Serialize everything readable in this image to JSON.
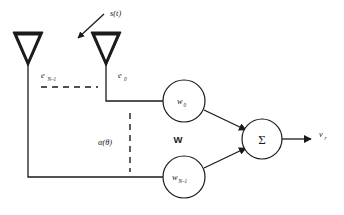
{
  "figure": {
    "kind": "beamformer-block-diagram",
    "background_color": "#ffffff",
    "line_color": "#1a1a1a"
  },
  "labels": {
    "incident_signal": "s(t)",
    "element_signal_top": "e",
    "element_signal_top_sub": "N–1",
    "element_signal_bottom": "e",
    "element_signal_bottom_sub": "0",
    "steering_vector": "α(θ)",
    "weight_vector": "W",
    "weight_top": "w",
    "weight_top_sub": "0",
    "weight_bottom": "w",
    "weight_bottom_sub": "N–1",
    "summation": "Σ",
    "output": "v",
    "output_sub": "r"
  },
  "nodes": [
    {
      "name": "antenna-element-n-minus-1",
      "label": "e",
      "sub": "N–1",
      "x": 28,
      "y": 50
    },
    {
      "name": "antenna-element-0",
      "label": "e",
      "sub": "0",
      "x": 105,
      "y": 50
    },
    {
      "name": "weight-node-0",
      "label": "w",
      "sub": "0",
      "cx": 184,
      "cy": 101,
      "r": 21
    },
    {
      "name": "weight-node-n-minus-1",
      "label": "w",
      "sub": "N–1",
      "cx": 184,
      "cy": 177,
      "r": 21
    },
    {
      "name": "summation-node",
      "label": "Σ",
      "cx": 262,
      "cy": 139,
      "r": 20
    }
  ],
  "edges": [
    {
      "name": "edge-element0-to-weight0",
      "from": "antenna-element-0",
      "to": "weight-node-0"
    },
    {
      "name": "edge-elementN-to-weightN",
      "from": "antenna-element-n-minus-1",
      "to": "weight-node-n-minus-1"
    },
    {
      "name": "edge-weight0-to-sum",
      "from": "weight-node-0",
      "to": "summation-node",
      "arrow": true
    },
    {
      "name": "edge-weightN-to-sum",
      "from": "weight-node-n-minus-1",
      "to": "summation-node",
      "arrow": true
    },
    {
      "name": "edge-sum-to-output",
      "from": "summation-node",
      "to": "output",
      "arrow": true
    },
    {
      "name": "edge-incident-signal-arrow",
      "from": "s(t)",
      "to": "array",
      "arrow": true
    }
  ]
}
